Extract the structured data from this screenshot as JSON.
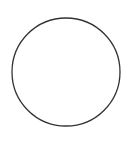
{
  "shape": {
    "type": "circle",
    "cx": 66,
    "cy": 72,
    "r": 54,
    "stroke_color": "#333333",
    "stroke_width": 1.3,
    "fill_color": "#ffffff"
  },
  "background_color": "#ffffff"
}
